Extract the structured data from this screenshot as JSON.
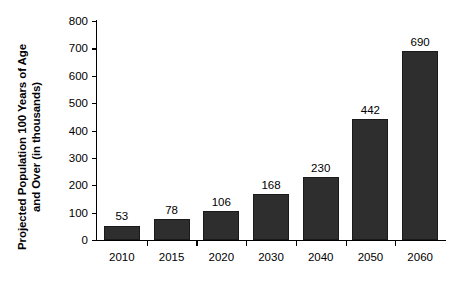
{
  "chart_data": {
    "type": "bar",
    "title": "",
    "xlabel": "",
    "ylabel": "Projected Population 100 Years of Age and Over (in thousands)",
    "ylabel_lines": [
      "Projected Population 100 Years of Age",
      "and Over (in thousands)"
    ],
    "categories": [
      "2010",
      "2015",
      "2020",
      "2030",
      "2040",
      "2050",
      "2060"
    ],
    "values": [
      53,
      78,
      106,
      168,
      230,
      442,
      690
    ],
    "value_labels": [
      "53",
      "78",
      "106",
      "168",
      "230",
      "442",
      "690"
    ],
    "ylim": [
      0,
      800
    ],
    "ytick_labels": [
      "0",
      "100",
      "200",
      "300",
      "400",
      "500",
      "600",
      "700",
      "800"
    ],
    "ytick_values": [
      0,
      100,
      200,
      300,
      400,
      500,
      600,
      700,
      800
    ],
    "grid": false,
    "legend": null,
    "bar_color": "#2e2e2e",
    "axis_color": "#000000",
    "background_color": "#ffffff"
  }
}
